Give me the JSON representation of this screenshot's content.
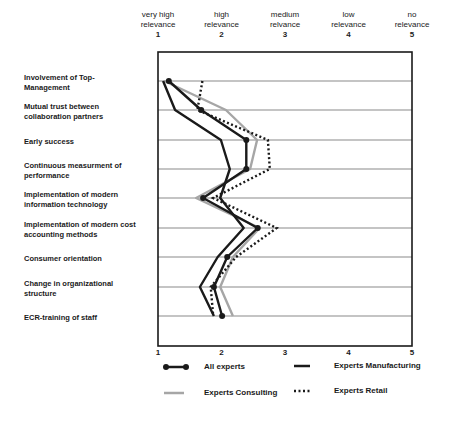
{
  "chart_data": {
    "type": "line",
    "orientation": "horizontal-profile",
    "title": "",
    "xlabel": "",
    "ylabel": "",
    "xlim": [
      1,
      5
    ],
    "x_ticks": [
      1,
      2,
      3,
      4,
      5
    ],
    "x_tick_headers": [
      {
        "line1": "very high",
        "line2": "relevance",
        "value": "1"
      },
      {
        "line1": "high",
        "line2": "relevance",
        "value": "2"
      },
      {
        "line1": "medium",
        "line2": "relvance",
        "value": "3"
      },
      {
        "line1": "low",
        "line2": "relevance",
        "value": "4"
      },
      {
        "line1": "no",
        "line2": "relevance",
        "value": "5"
      }
    ],
    "bottom_ticks": [
      "1",
      "2",
      "3",
      "4",
      "5"
    ],
    "grid": true,
    "legend_position": "bottom",
    "categories": [
      {
        "line1": "Involvement of Top-",
        "line2": "Management"
      },
      {
        "line1": "Mutual trust between",
        "line2": "collaboration partners"
      },
      {
        "line1": "Early success",
        "line2": ""
      },
      {
        "line1": "Continuous measurment of",
        "line2": "performance"
      },
      {
        "line1": "Implementation of modern",
        "line2": "information technology"
      },
      {
        "line1": "Implementation of modern cost",
        "line2": "accounting methods"
      },
      {
        "line1": "Consumer orientation",
        "line2": ""
      },
      {
        "line1": "Change in organizational",
        "line2": "structure"
      },
      {
        "line1": "ECR-training of staff",
        "line2": ""
      }
    ],
    "series": [
      {
        "name": "All experts",
        "style": "solid-dots",
        "color": "#1a1a1a",
        "values": [
          1.17,
          1.68,
          2.39,
          2.39,
          1.71,
          2.57,
          2.09,
          1.88,
          2.01
        ]
      },
      {
        "name": "Experts Manufacturing",
        "style": "solid",
        "color": "#1a1a1a",
        "values": [
          1.08,
          1.27,
          1.99,
          2.13,
          1.98,
          2.35,
          1.94,
          1.66,
          1.88
        ]
      },
      {
        "name": "Experts Consulting",
        "style": "solid",
        "color": "#a6a6a6",
        "values": [
          1.1,
          2.07,
          2.56,
          2.45,
          1.6,
          2.6,
          2.18,
          1.98,
          2.18
        ]
      },
      {
        "name": "Experts Retail",
        "style": "dotted",
        "color": "#1a1a1a",
        "values": [
          1.7,
          1.62,
          2.73,
          2.76,
          1.87,
          2.87,
          2.23,
          1.83,
          1.87
        ]
      }
    ]
  },
  "legend": {
    "all": "All experts",
    "manufacturing": "Experts Manufacturing",
    "consulting": "Experts Consulting",
    "retail": "Experts Retail"
  }
}
